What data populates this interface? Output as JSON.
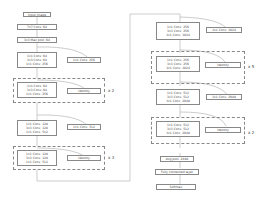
{
  "left": {
    "input": "Input image",
    "conv1": "7x7 Conv, 64",
    "pool": "3x3 Max pool, 64",
    "block1": [
      "1x1 Conv, 64",
      "3x3 Conv, 64",
      "1x1 Conv, 256"
    ],
    "proj1": "1x1 Conv, 256",
    "group1": {
      "lines": [
        "1x1 Conv, 64",
        "3x3 Conv, 64",
        "1x1 Conv, 256"
      ],
      "shortcut": "Identity",
      "mult": "x 2"
    },
    "block2": [
      "1x1 Conv, 128",
      "3x3 Conv, 128",
      "1x1 Conv, 512"
    ],
    "proj2": "1x1 Conv, 512",
    "group2": {
      "lines": [
        "1x1 Conv, 128",
        "3x3 Conv, 128",
        "1x1 Conv, 512"
      ],
      "shortcut": "Identity",
      "mult": "x 3"
    }
  },
  "right": {
    "block3": [
      "1x1 Conv, 256",
      "3x3 Conv, 256",
      "1x1 Conv, 1024"
    ],
    "proj3": "1x1 Conv, 1024",
    "group3": {
      "lines": [
        "1x1 Conv, 256",
        "3x3 Conv, 256",
        "1x1 Conv, 1024"
      ],
      "shortcut": "Identity",
      "mult": "x 5"
    },
    "block4": [
      "1x1 Conv, 512",
      "3x3 Conv, 512",
      "1x1 Conv, 2048"
    ],
    "proj4": "1x1 Conv, 2048",
    "group4": {
      "lines": [
        "1x1 Conv, 512",
        "3x3 Conv, 512",
        "1x1 Conv, 2048"
      ],
      "shortcut": "Identity",
      "mult": "x 2"
    },
    "avgpool": "Avg pool, 2048",
    "fc": "Fully connected layer",
    "softmax": "Softmax"
  }
}
